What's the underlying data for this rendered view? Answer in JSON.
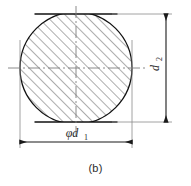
{
  "figure": {
    "caption": "(b)",
    "type": "engineering-cross-section",
    "colors": {
      "outline": "#111111",
      "hatch": "#555555",
      "centerline": "#777777",
      "dimension": "#222222",
      "extension": "#888888",
      "text": "#2b2b2b",
      "background": "#ffffff"
    }
  },
  "dimensions": {
    "horizontal": {
      "label": "φd",
      "subscript": "1",
      "full_label": "φd₁",
      "name": "diameter-d1",
      "orientation": "horizontal",
      "position": "bottom",
      "arrowheads": "both"
    },
    "vertical": {
      "label": "d",
      "subscript": "2",
      "full_label": "d₂",
      "name": "across-flats-d2",
      "orientation": "vertical",
      "position": "right",
      "rotation_deg": -90,
      "arrowheads": "both"
    }
  },
  "geometry": {
    "circle": {
      "center_x": 76,
      "center_y": 68,
      "radius": 56
    },
    "flat_top_y": 14,
    "flat_bottom_y": 122,
    "hatch_angle_deg": 45,
    "hatch_spacing_px": 7
  },
  "centerlines": {
    "horizontal_label": "horizontal-centerline",
    "vertical_label": "vertical-centerline",
    "style": "dash-dot"
  }
}
